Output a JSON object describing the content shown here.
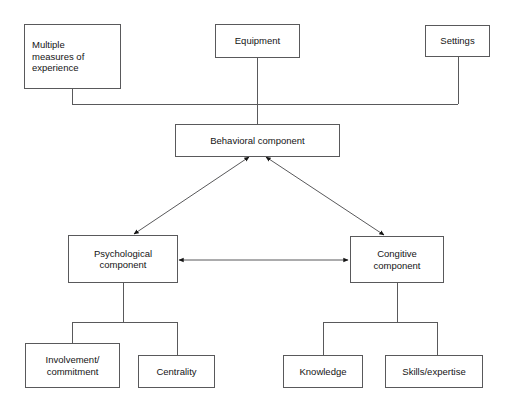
{
  "diagram": {
    "background_color": "#ffffff",
    "line_color": "#59595b",
    "text_color": "#141414",
    "nodes": [
      {
        "id": "multiple-measures",
        "label": "Multiple\nmeasures of\nexperience",
        "align": "left"
      },
      {
        "id": "equipment",
        "label": "Equipment",
        "align": "center"
      },
      {
        "id": "settings",
        "label": "Settings",
        "align": "center"
      },
      {
        "id": "behavioral-component",
        "label": "Behavioral component",
        "align": "center"
      },
      {
        "id": "psychological-component",
        "label": "Psychological\ncomponent",
        "align": "center"
      },
      {
        "id": "congitive-component",
        "label": "Congitive\ncomponent",
        "align": "center"
      },
      {
        "id": "involvement-commitment",
        "label": "Involvement/\ncommitment",
        "align": "center"
      },
      {
        "id": "centrality",
        "label": "Centrality",
        "align": "center"
      },
      {
        "id": "knowledge",
        "label": "Knowledge",
        "align": "center"
      },
      {
        "id": "skills-expertise",
        "label": "Skills/expertise",
        "align": "center"
      }
    ]
  }
}
